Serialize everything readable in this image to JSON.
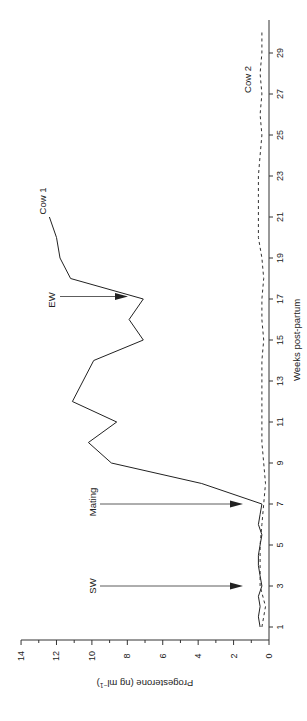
{
  "chart_data": {
    "type": "line",
    "title": "",
    "orientation": "rotated-90-ccw",
    "xlabel": "Weeks post-partum",
    "ylabel": "Progesterone (ng ml⁻¹)",
    "ylabel_main": "Progesterone (ng ml",
    "ylabel_sup": "−1",
    "ylabel_close": ")",
    "xlim": [
      0.5,
      30.5
    ],
    "ylim": [
      0,
      14
    ],
    "x_ticks": [
      1,
      3,
      5,
      7,
      9,
      11,
      13,
      15,
      17,
      19,
      21,
      23,
      25,
      27,
      29
    ],
    "x_tick_labels": [
      "1",
      "3",
      "5",
      "7",
      "9",
      "11",
      "13",
      "15",
      "17",
      "19",
      "21",
      "23",
      "25",
      "27",
      "29"
    ],
    "y_ticks": [
      0,
      2,
      4,
      6,
      8,
      10,
      12,
      14
    ],
    "y_tick_labels": [
      "0",
      "2",
      "4",
      "6",
      "8",
      "10",
      "12",
      "14"
    ],
    "grid": false,
    "series": [
      {
        "name": "Cow 1",
        "style": "solid",
        "x": [
          1,
          1.5,
          2,
          2.5,
          3,
          3.5,
          4,
          4.5,
          5,
          5.5,
          6,
          6.5,
          7,
          8,
          9,
          10,
          11,
          12,
          14,
          15,
          16,
          17,
          18,
          19,
          20,
          21
        ],
        "values": [
          0.5,
          0.6,
          0.5,
          0.6,
          0.4,
          0.5,
          0.6,
          0.6,
          0.5,
          0.4,
          0.6,
          0.5,
          0.4,
          3.8,
          8.9,
          10.2,
          8.6,
          11.1,
          9.9,
          7.1,
          7.9,
          7.1,
          11.2,
          11.8,
          12.0,
          12.4
        ]
      },
      {
        "name": "Cow 2",
        "style": "dashed",
        "x": [
          1,
          2,
          3,
          4,
          5,
          6,
          7,
          8,
          9,
          10,
          11,
          12,
          13,
          14,
          15,
          16,
          17,
          18,
          19,
          20,
          21,
          22,
          23,
          24,
          25,
          26,
          27,
          28,
          29,
          30
        ],
        "values": [
          0.4,
          0.2,
          0.5,
          0.5,
          0.5,
          0.4,
          0.3,
          0.2,
          0.3,
          0.4,
          0.4,
          0.4,
          0.4,
          0.4,
          0.3,
          0.4,
          0.4,
          0.3,
          0.4,
          0.6,
          0.6,
          0.6,
          0.6,
          0.5,
          0.4,
          0.5,
          0.4,
          0.5,
          0.4,
          0.4
        ]
      }
    ],
    "annotations": [
      {
        "label": "SW",
        "x": 3,
        "type": "arrow"
      },
      {
        "label": "Mating",
        "x": 7,
        "type": "arrow"
      },
      {
        "label": "EW",
        "x": 17,
        "type": "arrow"
      },
      {
        "label": "Cow 1",
        "x": 21,
        "type": "series-label"
      },
      {
        "label": "Cow 2",
        "x": 28,
        "type": "series-label"
      }
    ],
    "legend": "none (direct series labels)"
  }
}
